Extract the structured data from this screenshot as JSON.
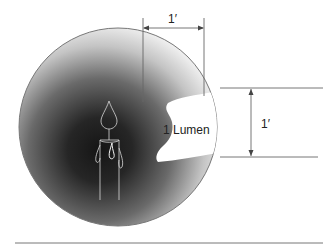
{
  "diagram": {
    "type": "illustration",
    "labels": {
      "lumen": "1 Lumen",
      "top_dimension": "1′",
      "side_dimension": "1′"
    },
    "elements": {
      "sphere": {
        "cx": 118,
        "cy": 127,
        "r": 99,
        "center_color": "#1a1a1a",
        "edge_color": "#f2f2f2"
      },
      "candle": {
        "x": 100,
        "y": 150
      },
      "cutout": "1 sq ft area on sphere surface",
      "top_dimension_arrow": "horizontal, 1 foot",
      "side_dimension_arrow": "vertical, 1 foot",
      "baseline": "horizontal rule"
    },
    "colors": {
      "stroke": "#666666",
      "text": "#222222",
      "background": "#ffffff"
    }
  }
}
